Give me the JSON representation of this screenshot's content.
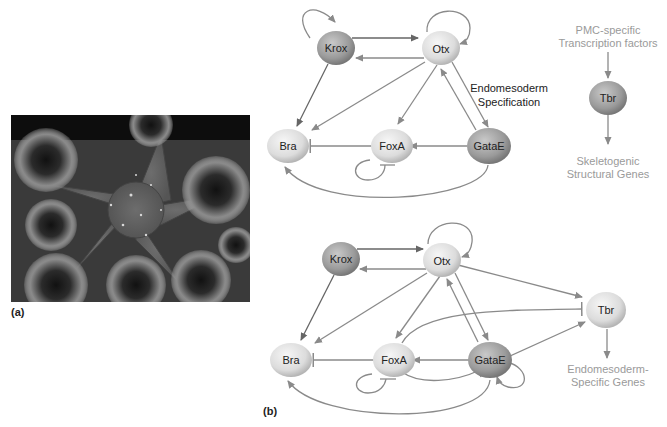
{
  "figure": {
    "panel_a_label": "(a)",
    "panel_b_label": "(b)",
    "photo_description": "Sea star surrounded by sea urchins (grayscale photograph)"
  },
  "top_network": {
    "nodes": {
      "krox": "Krox",
      "otx": "Otx",
      "bra": "Bra",
      "foxa": "FoxA",
      "gatae": "GataE"
    },
    "annotation_line1": "Endomesoderm",
    "annotation_line2": "Specification",
    "pmc": {
      "input_line1": "PMC-specific",
      "input_line2": "Transcription factors",
      "node": "Tbr",
      "output_line1": "Skeletogenic",
      "output_line2": "Structural Genes"
    }
  },
  "bottom_network": {
    "nodes": {
      "krox": "Krox",
      "otx": "Otx",
      "bra": "Bra",
      "foxa": "FoxA",
      "gatae": "GataE",
      "tbr": "Tbr"
    },
    "output_line1": "Endomesoderm-",
    "output_line2": "Specific Genes"
  },
  "colors": {
    "edge": "#8a8a8a",
    "edge_dark": "#666666",
    "node_light": "#e2e2e2",
    "node_dark": "#9a9a9a",
    "pmc_text": "#9a9a9a"
  }
}
